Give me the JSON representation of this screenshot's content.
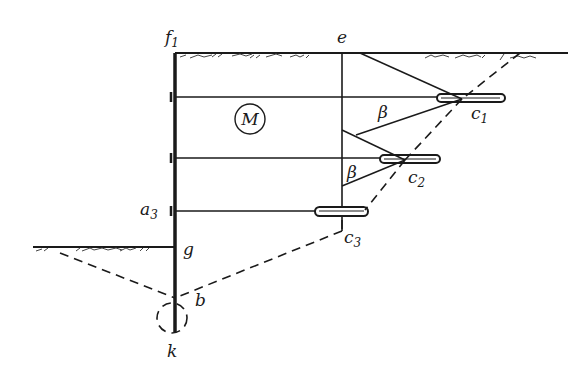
{
  "diagram": {
    "type": "anchored sheet pile wall cross-section",
    "labels": {
      "f1": {
        "base": "f",
        "sub": "1"
      },
      "e": "e",
      "M": "M",
      "beta_upper": "β",
      "beta_lower": "β",
      "c1": {
        "base": "c",
        "sub": "1"
      },
      "c2": {
        "base": "c",
        "sub": "2"
      },
      "c3": {
        "base": "c",
        "sub": "3"
      },
      "a3": {
        "base": "a",
        "sub": "3"
      },
      "g": "g",
      "b": "b",
      "k": "k"
    },
    "colors": {
      "ink": "#1a1a1a",
      "background": "#ffffff"
    }
  }
}
